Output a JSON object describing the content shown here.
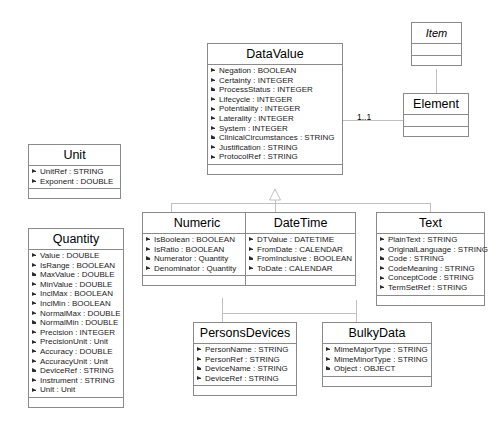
{
  "diagram": {
    "line_color": "#b9b9b9",
    "border_color": "#8a8a8a",
    "background": "#ffffff"
  },
  "classes": [
    {
      "id": "item",
      "name": "Item",
      "abstract": true,
      "x": 411,
      "y": 22,
      "w": 51,
      "attributes": []
    },
    {
      "id": "element",
      "name": "Element",
      "abstract": false,
      "x": 403,
      "y": 93,
      "w": 66,
      "attributes": []
    },
    {
      "id": "datavalue",
      "name": "DataValue",
      "abstract": false,
      "x": 207,
      "y": 43,
      "w": 136,
      "attributes": [
        "Negation : BOOLEAN",
        "Certainty : INTEGER",
        "ProcessStatus : INTEGER",
        "Lifecycle : INTEGER",
        "Potentiality : INTEGER",
        "Laterality : INTEGER",
        "System : INTEGER",
        "ClinicalCircumstances : STRING",
        "Justification : STRING",
        "ProtocolRef : STRING"
      ]
    },
    {
      "id": "unit",
      "name": "Unit",
      "abstract": false,
      "x": 28,
      "y": 144,
      "w": 93,
      "attributes": [
        "UnitRef : STRING",
        "Exponent : DOUBLE"
      ]
    },
    {
      "id": "quantity",
      "name": "Quantity",
      "abstract": false,
      "x": 28,
      "y": 228,
      "w": 96,
      "attributes": [
        "Value : DOUBLE",
        "IsRange : BOOLEAN",
        "MaxValue : DOUBLE",
        "MinValue : DOUBLE",
        "InclMax : BOOLEAN",
        "InclMin : BOOLEAN",
        "NormalMax : DOUBLE",
        "NormalMin : DOUBLE",
        "Precision : INTEGER",
        "PrecisionUnit : Unit",
        "Accuracy : DOUBLE",
        "AccuracyUnit : Unit",
        "DeviceRef : STRING",
        "Instrument : STRING",
        "Unit : Unit"
      ]
    },
    {
      "id": "numeric",
      "name": "Numeric",
      "abstract": false,
      "x": 142,
      "y": 212,
      "w": 110,
      "attributes": [
        "IsBoolean : BOOLEAN",
        "IsRatio : BOOLEAN",
        "Numerator : Quantity",
        "Denominator : Quantity"
      ]
    },
    {
      "id": "datetime",
      "name": "DateTime",
      "abstract": false,
      "x": 245,
      "y": 212,
      "w": 111,
      "attributes": [
        "DTValue : DATETIME",
        "FromDate : CALENDAR",
        "FromInclusive : BOOLEAN",
        "ToDate : CALENDAR"
      ]
    },
    {
      "id": "text",
      "name": "Text",
      "abstract": false,
      "x": 376,
      "y": 212,
      "w": 109,
      "attributes": [
        "PlainText : STRING",
        "OriginalLanguage : STRING",
        "Code : STRING",
        "CodeMeaning : STRING",
        "ConceptCode : STRING",
        "TermSetRef : STRING"
      ]
    },
    {
      "id": "personsdevices",
      "name": "PersonsDevices",
      "abstract": false,
      "x": 193,
      "y": 322,
      "w": 104,
      "attributes": [
        "PersonName : STRING",
        "PersonRef : STRING",
        "DeviceName : STRING",
        "DeviceRef : STRING"
      ]
    },
    {
      "id": "bulkydata",
      "name": "BulkyData",
      "abstract": false,
      "x": 322,
      "y": 322,
      "w": 110,
      "attributes": [
        "MimeMajorType : STRING",
        "MimeMinorType : STRING",
        "Object : OBJECT"
      ]
    }
  ],
  "multiplicities": [
    {
      "id": "element-mult",
      "label": "1..1",
      "x": 357,
      "y": 112
    }
  ],
  "relationships": [
    {
      "from": "element",
      "to": "item",
      "type": "generalization"
    },
    {
      "from": "datavalue",
      "to": "element",
      "type": "association"
    },
    {
      "from": "numeric",
      "to": "datavalue",
      "type": "generalization"
    },
    {
      "from": "datetime",
      "to": "datavalue",
      "type": "generalization"
    },
    {
      "from": "text",
      "to": "datavalue",
      "type": "generalization"
    },
    {
      "from": "personsdevices",
      "to": "datavalue",
      "type": "generalization"
    },
    {
      "from": "bulkydata",
      "to": "datavalue",
      "type": "generalization"
    }
  ]
}
